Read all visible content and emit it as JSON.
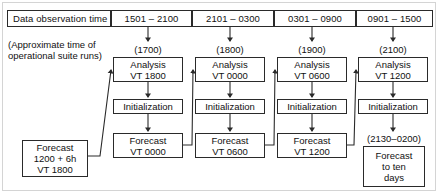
{
  "figure": {
    "line_color": "#2a2a2a",
    "background": "#ffffff"
  },
  "header": {
    "row_label": "Data observation time",
    "columns": [
      {
        "label": "1501 – 2100"
      },
      {
        "label": "2101 – 0300"
      },
      {
        "label": "0301 – 0900"
      },
      {
        "label": "0901 – 1500"
      }
    ]
  },
  "side_note": {
    "line1": "(Approximate time of",
    "line2": "operational suite runs)"
  },
  "columns": [
    {
      "run_time": "(1700)",
      "analysis": {
        "line1": "Analysis",
        "line2": "VT 1800"
      },
      "initialization": {
        "line1": "Initialization"
      },
      "forecast": {
        "line1": "Forecast",
        "line2": "VT 0000"
      }
    },
    {
      "run_time": "(1800)",
      "analysis": {
        "line1": "Analysis",
        "line2": "VT 0000"
      },
      "initialization": {
        "line1": "Initialization"
      },
      "forecast": {
        "line1": "Forecast",
        "line2": "VT 0600"
      }
    },
    {
      "run_time": "(1900)",
      "analysis": {
        "line1": "Analysis",
        "line2": "VT 0600"
      },
      "initialization": {
        "line1": "Initialization"
      },
      "forecast": {
        "line1": "Forecast",
        "line2": "VT 1200"
      }
    },
    {
      "run_time": "(2100)",
      "analysis": {
        "line1": "Analysis",
        "line2": "VT 1200"
      },
      "initialization": {
        "line1": "Initialization"
      },
      "forecast_time": "(2130–0200)",
      "forecast": {
        "line1": "Forecast",
        "line2": "to ten",
        "line3": "days"
      }
    }
  ],
  "seed_forecast": {
    "line1": "Forecast",
    "line2": "1200 + 6h",
    "line3": "VT 1800"
  }
}
